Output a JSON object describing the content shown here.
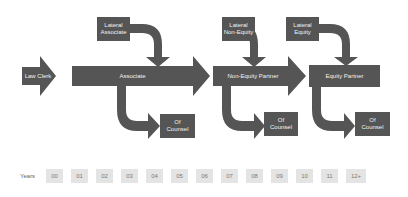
{
  "diagram": {
    "colors": {
      "shape": "#555555",
      "label": "#f2f2f2",
      "year_box": "#e4e4e4",
      "year_text": "#7a7a7a"
    },
    "stages": [
      {
        "id": "law-clerk",
        "label": "Law Clerk"
      },
      {
        "id": "associate",
        "label": "Associate"
      },
      {
        "id": "non-equity-partner",
        "label": "Non-Equity Partner"
      },
      {
        "id": "equity-partner",
        "label": "Equity Partner"
      }
    ],
    "laterals": [
      {
        "label_line1": "Lateral",
        "label_line2": "Associate"
      },
      {
        "label_line1": "Lateral",
        "label_line2": "Non-Equity"
      },
      {
        "label_line1": "Lateral",
        "label_line2": "Equity"
      }
    ],
    "exits": [
      {
        "label_line1": "Of",
        "label_line2": "Counsel"
      },
      {
        "label_line1": "Of",
        "label_line2": "Counsel"
      },
      {
        "label_line1": "Of",
        "label_line2": "Counsel"
      }
    ]
  },
  "timeline": {
    "label": "Years",
    "years": [
      "00",
      "01",
      "02",
      "03",
      "04",
      "05",
      "06",
      "07",
      "08",
      "09",
      "10",
      "11",
      "12+"
    ]
  }
}
